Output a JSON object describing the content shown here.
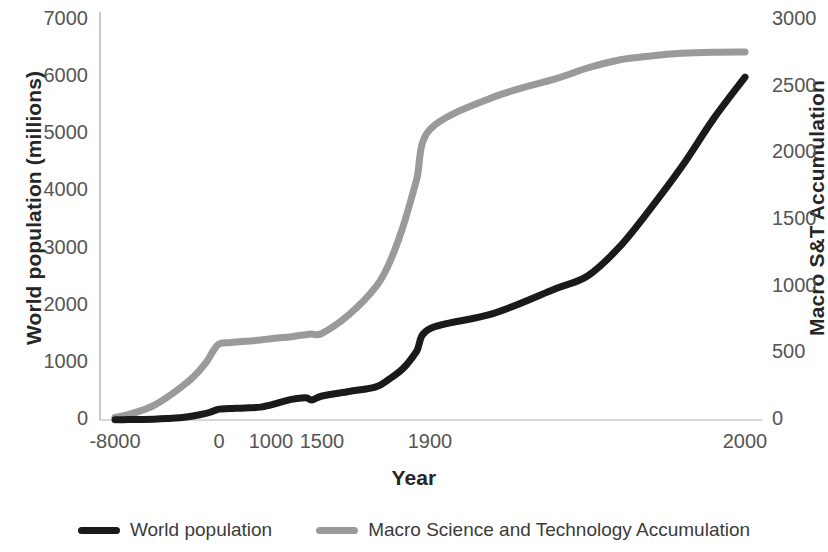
{
  "chart_data": {
    "type": "line",
    "title": "",
    "xlabel": "Year",
    "ylabel": "World population (millions)",
    "y2label": "Macro S&T Accumulation",
    "grid": false,
    "legend_position": "bottom",
    "xtick_labels": [
      "-8000",
      "0",
      "1000",
      "1500",
      "1900",
      "2000"
    ],
    "xtick_positions": [
      115,
      219,
      271,
      322,
      430,
      745
    ],
    "ytick_labels_left": [
      "0",
      "1000",
      "2000",
      "3000",
      "4000",
      "5000",
      "6000",
      "7000"
    ],
    "ytick_labels_right": [
      "0",
      "500",
      "1000",
      "1500",
      "2000",
      "2500",
      "3000"
    ],
    "ylim_left": [
      0,
      7000
    ],
    "ylim_right": [
      0,
      3000
    ],
    "series": [
      {
        "name": "World population",
        "axis": "left",
        "color": "#1a1a1a",
        "x": [
          -8000,
          -7000,
          -6000,
          -5000,
          -4000,
          -3000,
          -2000,
          -1000,
          -500,
          0,
          200,
          500,
          800,
          1000,
          1200,
          1340,
          1400,
          1500,
          1600,
          1700,
          1750,
          1800,
          1850,
          1900,
          1920,
          1940,
          1950,
          1960,
          1970,
          1980,
          1990,
          2000
        ],
        "values": [
          5,
          7,
          10,
          15,
          25,
          40,
          70,
          115,
          150,
          190,
          200,
          210,
          225,
          265,
          360,
          390,
          350,
          420,
          500,
          580,
          720,
          900,
          1200,
          1600,
          1860,
          2300,
          2520,
          3020,
          3700,
          4440,
          5270,
          6000
        ]
      },
      {
        "name": "Macro Science and Technology Accumulation",
        "axis": "right",
        "color": "#9a9a9a",
        "x": [
          -8000,
          -7000,
          -6000,
          -5000,
          -4000,
          -3000,
          -2000,
          -1000,
          -500,
          0,
          200,
          500,
          800,
          1000,
          1200,
          1340,
          1400,
          1500,
          1600,
          1700,
          1750,
          1800,
          1850,
          1900,
          1920,
          1940,
          1950,
          1960,
          1970,
          1980,
          1990,
          2000
        ],
        "values": [
          20,
          40,
          70,
          110,
          170,
          240,
          320,
          430,
          510,
          570,
          580,
          590,
          600,
          610,
          625,
          640,
          645,
          650,
          790,
          1000,
          1180,
          1450,
          1800,
          2180,
          2420,
          2560,
          2640,
          2700,
          2730,
          2750,
          2758,
          2760
        ]
      }
    ]
  },
  "legend": {
    "entries": [
      {
        "label": "World population",
        "color": "#1a1a1a"
      },
      {
        "label": "Macro Science and Technology Accumulation",
        "color": "#9a9a9a"
      }
    ]
  }
}
